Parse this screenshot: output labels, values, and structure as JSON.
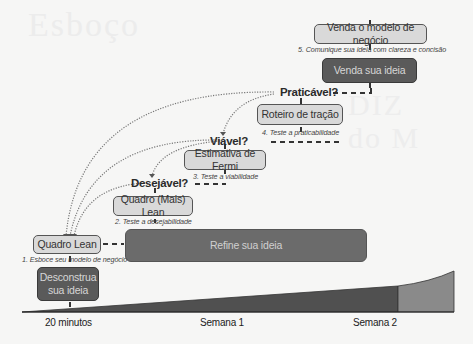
{
  "diagram": {
    "boxes": {
      "venda_modelo": "Venda o modelo de negócio",
      "venda_ideia": "Venda sua ideia",
      "roteiro_tracao": "Roteiro de tração",
      "estimativa_fermi": "Estimativa de Fermi",
      "quadro_mais_lean": "Quadro (Mais) Lean",
      "quadro_lean": "Quadro Lean",
      "desconstrua": "Desconstrua sua ideia",
      "refine": "Refine sua ideia"
    },
    "captions": {
      "step1": "1. Esboce seu modelo de negócio",
      "step2": "2. Teste a desejabilidade",
      "step3": "3. Teste a viabilidade",
      "step4": "4. Teste a praticabilidade",
      "step5": "5. Comunique sua ideia com clareza e concisão"
    },
    "questions": {
      "desejavel": "Desejável?",
      "viavel": "Viável?",
      "praticavel": "Praticável?"
    },
    "timeline": {
      "ticks": [
        "20 minutos",
        "Semana 1",
        "Semana 2"
      ]
    },
    "colors": {
      "light_box": "#d9d9d9",
      "dark_box": "#5a5a5a",
      "refine_box": "#6b6b6b",
      "timeline_dark": "#505050",
      "timeline_light": "#8a8a8a",
      "background": "#f6f6f5"
    }
  }
}
